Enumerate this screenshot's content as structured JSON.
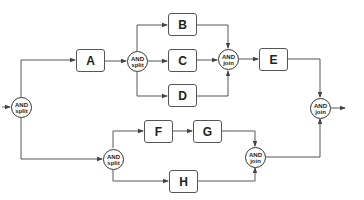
{
  "diagram": {
    "type": "workflow",
    "tasks": [
      {
        "id": "A",
        "label": "A"
      },
      {
        "id": "B",
        "label": "B"
      },
      {
        "id": "C",
        "label": "C"
      },
      {
        "id": "D",
        "label": "D"
      },
      {
        "id": "E",
        "label": "E"
      },
      {
        "id": "F",
        "label": "F"
      },
      {
        "id": "G",
        "label": "G"
      },
      {
        "id": "H",
        "label": "H"
      }
    ],
    "gates": [
      {
        "id": "split_main",
        "line1": "AND",
        "line2": "split"
      },
      {
        "id": "split_top",
        "line1": "AND",
        "line2": "split"
      },
      {
        "id": "join_top",
        "line1": "AND",
        "line2": "join"
      },
      {
        "id": "split_bottom",
        "line1": "AND",
        "line2": "split"
      },
      {
        "id": "join_bottom",
        "line1": "AND",
        "line2": "join"
      },
      {
        "id": "join_main",
        "line1": "AND",
        "line2": "join"
      }
    ],
    "edges": [
      [
        "start",
        "split_main"
      ],
      [
        "split_main",
        "A"
      ],
      [
        "split_main",
        "split_bottom"
      ],
      [
        "A",
        "split_top"
      ],
      [
        "split_top",
        "B"
      ],
      [
        "split_top",
        "C"
      ],
      [
        "split_top",
        "D"
      ],
      [
        "B",
        "join_top"
      ],
      [
        "C",
        "join_top"
      ],
      [
        "D",
        "join_top"
      ],
      [
        "join_top",
        "E"
      ],
      [
        "E",
        "join_main"
      ],
      [
        "split_bottom",
        "F"
      ],
      [
        "F",
        "G"
      ],
      [
        "split_bottom",
        "H"
      ],
      [
        "G",
        "join_bottom"
      ],
      [
        "H",
        "join_bottom"
      ],
      [
        "join_bottom",
        "join_main"
      ],
      [
        "join_main",
        "end"
      ]
    ],
    "colors": {
      "line": "#444444",
      "text": "#222222",
      "background": "#ffffff"
    }
  }
}
